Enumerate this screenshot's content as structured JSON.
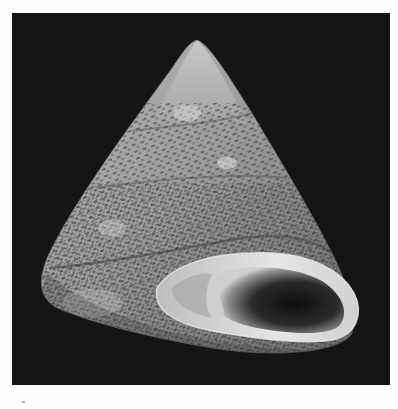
{
  "image": {
    "subject": "top shell (trochid gastropod)",
    "view": "apertural view, apex up",
    "background_color": "#151515",
    "border_color": "#fdfdfd",
    "shell_base_color": "#9a9a9a",
    "shell_highlight_color": "#d4d4d4",
    "shell_dark_mottling_color": "#3a3a3a",
    "aperture_interior_color": "#1a1a1a",
    "aperture_lip_color": "#e0e0e0",
    "colorspace": "grayscale"
  }
}
